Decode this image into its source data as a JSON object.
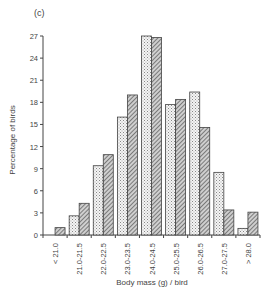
{
  "panel_label": "(c)",
  "chart_data": {
    "type": "bar",
    "title": "(c)",
    "xlabel": "Body mass (g) / bird",
    "ylabel": "Percentage of birds",
    "ylim": [
      0,
      27
    ],
    "yticks": [
      0,
      3,
      6,
      9,
      12,
      15,
      18,
      21,
      24,
      27
    ],
    "grid": false,
    "legend": null,
    "categories": [
      "< 21.0",
      "21.0-21.5",
      "22.0-22.5",
      "23.0-23.5",
      "24.0-24.5",
      "25.0-25.5",
      "26.0-26.5",
      "27.0-27.5",
      "> 28.0"
    ],
    "series": [
      {
        "name": "Series 1 (light dotted)",
        "pattern": "dotted",
        "values": [
          0,
          2.6,
          9.4,
          16.0,
          27.0,
          17.7,
          19.4,
          8.5,
          0.9
        ]
      },
      {
        "name": "Series 2 (dark hatched)",
        "pattern": "hatched",
        "values": [
          1.0,
          4.3,
          10.9,
          19.0,
          26.8,
          18.4,
          14.6,
          3.4,
          3.1
        ]
      }
    ]
  }
}
